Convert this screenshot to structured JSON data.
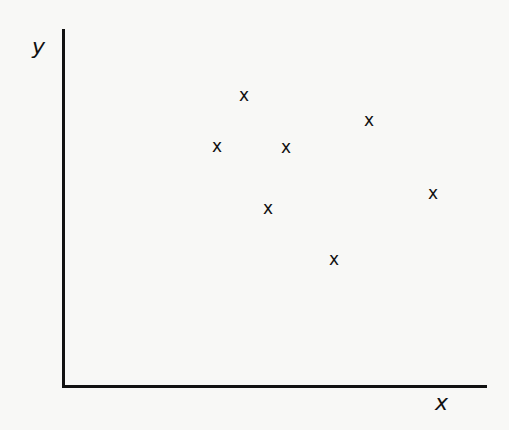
{
  "chart_data": {
    "type": "scatter",
    "title": "",
    "xlabel": "x",
    "ylabel": "y",
    "marker": "x",
    "ticks": "none",
    "grid": false,
    "legend": null,
    "axis_pixel_origin": [
      63,
      386
    ],
    "xlim": [
      0,
      424
    ],
    "ylim": [
      0,
      357
    ],
    "points": [
      {
        "x": 181,
        "y": 291,
        "label": "x"
      },
      {
        "x": 154,
        "y": 240,
        "label": "x"
      },
      {
        "x": 223,
        "y": 239,
        "label": "x"
      },
      {
        "x": 205,
        "y": 178,
        "label": "x"
      },
      {
        "x": 306,
        "y": 266,
        "label": "x"
      },
      {
        "x": 370,
        "y": 193,
        "label": "x"
      },
      {
        "x": 271,
        "y": 127,
        "label": "x"
      }
    ]
  },
  "labels": {
    "x_axis": "x",
    "y_axis": "y"
  }
}
